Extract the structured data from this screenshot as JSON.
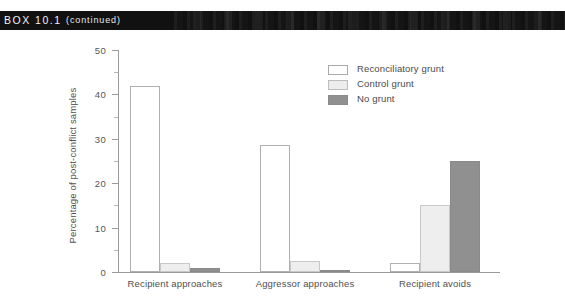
{
  "header": {
    "box_label": "BOX 10.1",
    "continued_label": "(continued)"
  },
  "chart_data": {
    "type": "bar",
    "title": "",
    "subtitle": "",
    "xlabel": "",
    "ylabel": "Percentage of post-conflict samples",
    "ylim": [
      0,
      50
    ],
    "ytick_labels": [
      "0",
      "10",
      "20",
      "30",
      "40",
      "50"
    ],
    "ytick_values": [
      0,
      10,
      20,
      30,
      40,
      50
    ],
    "minor_tick_values": [
      5,
      15,
      25,
      35,
      45
    ],
    "grid": false,
    "legend_position": "top-right",
    "categories": [
      "Recipient approaches",
      "Aggressor approaches",
      "Recipient avoids"
    ],
    "series": [
      {
        "name": "Reconciliatory grunt",
        "color": "#ffffff",
        "values": [
          42,
          28.5,
          2
        ]
      },
      {
        "name": "Control grunt",
        "color": "#eeeeee",
        "values": [
          2,
          2.5,
          15
        ]
      },
      {
        "name": "No grunt",
        "color": "#909090",
        "values": [
          1,
          0.5,
          25
        ]
      }
    ]
  }
}
